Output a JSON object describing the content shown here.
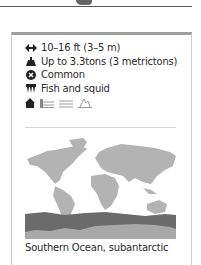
{
  "facts": {
    "length": {
      "icon": "length-arrows-icon",
      "text": "10–16 ft (3–5 m)"
    },
    "weight": {
      "icon": "weight-icon",
      "text": "Up to 3.3tons (3 metrictons)"
    },
    "status": {
      "icon": "status-x-icon",
      "text": "Common"
    },
    "diet": {
      "icon": "diet-teeth-icon",
      "text": "Fish and squid"
    },
    "habitats": [
      "home-icon",
      "coast-icon",
      "open-ocean-icon",
      "ice-icon"
    ]
  },
  "map": {
    "land_color": "#b3b3b3",
    "range_color": "#6b6b6b",
    "antarctica_color": "#a8a8a8"
  },
  "caption": "Southern Ocean, subantarctic"
}
